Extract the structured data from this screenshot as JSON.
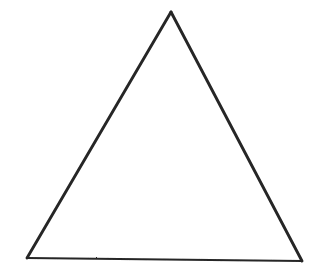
{
  "canvas": {
    "width": 322,
    "height": 278,
    "background_color": "#ffffff",
    "title": "hand-drawn triangle"
  },
  "drawing": {
    "name": "triangle-outline",
    "style": "hand-drawn ink outline, unfilled",
    "stroke_color": "#262626",
    "fill_color": "none",
    "vertices": [
      {
        "label": "apex",
        "x": 171,
        "y": 12
      },
      {
        "label": "bottom-right",
        "x": 302,
        "y": 261
      },
      {
        "label": "bottom-left",
        "x": 27,
        "y": 258
      }
    ],
    "edges": [
      {
        "name": "left-side",
        "from": "apex",
        "to": "bottom-left",
        "stroke_width": 2.9,
        "path": "M 171 12 L 27 258"
      },
      {
        "name": "right-side",
        "from": "apex",
        "to": "bottom-right",
        "stroke_width": 2.9,
        "path": "M 171 12 L 302 261"
      },
      {
        "name": "base",
        "from": "bottom-left",
        "to": "bottom-right",
        "stroke_width": 1.9,
        "path": "M 27 258 L 302 261"
      }
    ]
  }
}
